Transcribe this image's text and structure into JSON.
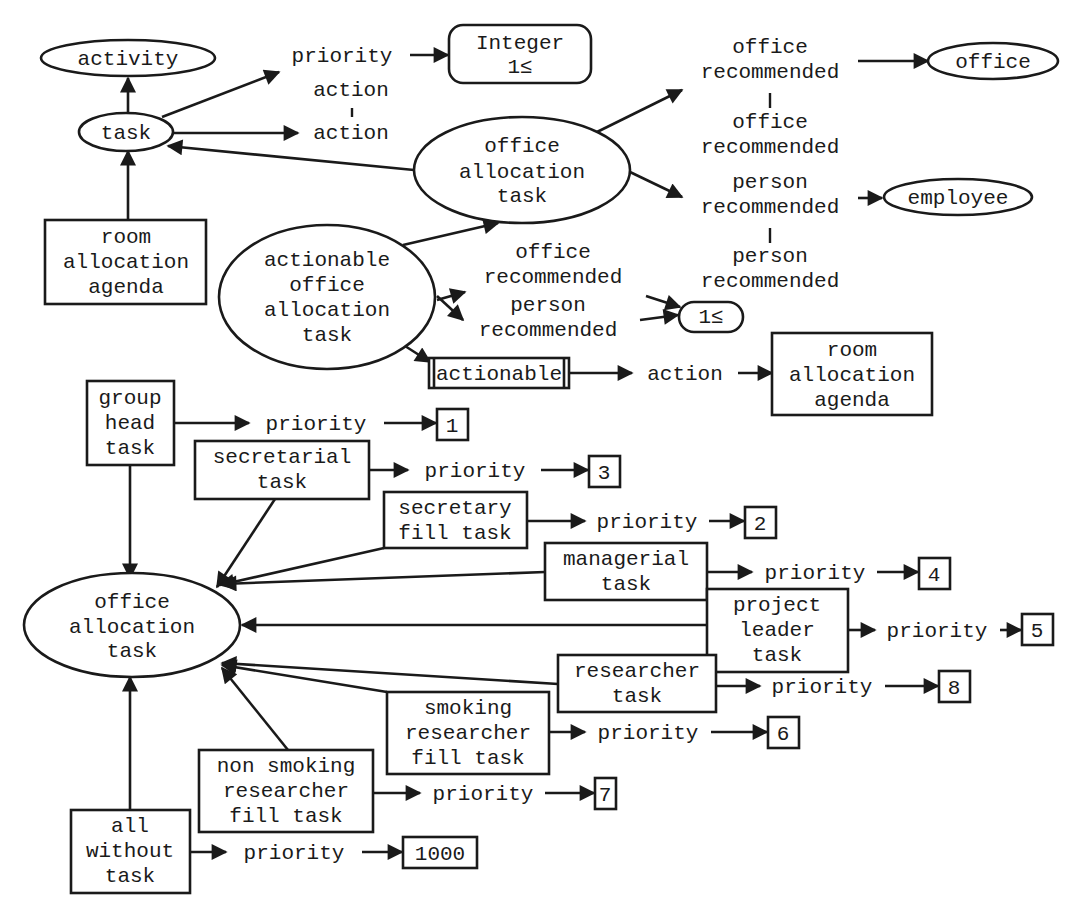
{
  "diagram": {
    "type": "conceptual-graph",
    "top": {
      "activity": "activity",
      "task": "task",
      "priority_rel": "priority",
      "integer_type": {
        "line1": "Integer",
        "line2": "1≤"
      },
      "action_rel_top": "action",
      "action_rel_bottom": "action",
      "room_agenda": {
        "line1": "room",
        "line2": "allocation",
        "line3": "agenda"
      },
      "office_alloc_task": {
        "line1": "office",
        "line2": "allocation",
        "line3": "task"
      },
      "office_rec_1": {
        "line1": "office",
        "line2": "recommended"
      },
      "office_rec_2": {
        "line1": "office",
        "line2": "recommended"
      },
      "office_concept": "office",
      "person_rec_1": {
        "line1": "person",
        "line2": "recommended"
      },
      "person_rec_2": {
        "line1": "person",
        "line2": "recommended"
      },
      "employee_concept": "employee"
    },
    "actionable": {
      "node": {
        "line1": "actionable",
        "line2": "office",
        "line3": "allocation",
        "line4": "task"
      },
      "office_rec": {
        "line1": "office",
        "line2": "recommended"
      },
      "person_rec": {
        "line1": "person",
        "line2": "recommended"
      },
      "card": "1≤",
      "actionable_box": "actionable",
      "action_rel": "action",
      "room_agenda": {
        "line1": "room",
        "line2": "allocation",
        "line3": "agenda"
      }
    },
    "bottom": {
      "office_alloc_task": {
        "line1": "office",
        "line2": "allocation",
        "line3": "task"
      },
      "priority_label": "priority",
      "tasks": [
        {
          "lines": [
            "group",
            "head",
            "task"
          ],
          "priority": "1"
        },
        {
          "lines": [
            "secretarial",
            "task"
          ],
          "priority": "3"
        },
        {
          "lines": [
            "secretary",
            "fill task"
          ],
          "priority": "2"
        },
        {
          "lines": [
            "managerial",
            "task"
          ],
          "priority": "4"
        },
        {
          "lines": [
            "project",
            "leader",
            "task"
          ],
          "priority": "5"
        },
        {
          "lines": [
            "researcher",
            "task"
          ],
          "priority": "8"
        },
        {
          "lines": [
            "smoking",
            "researcher",
            "fill task"
          ],
          "priority": "6"
        },
        {
          "lines": [
            "non smoking",
            "researcher",
            "fill task"
          ],
          "priority": "7"
        },
        {
          "lines": [
            "all",
            "without",
            "task"
          ],
          "priority": "1000"
        }
      ]
    }
  }
}
